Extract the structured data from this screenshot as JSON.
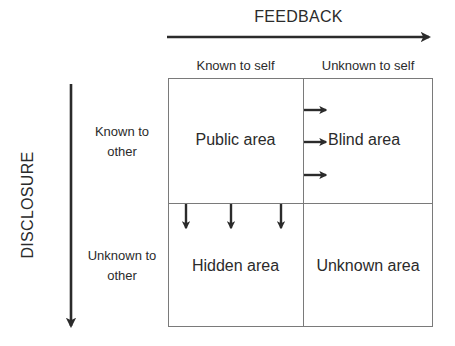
{
  "diagram": {
    "axes": {
      "horizontal": {
        "label": "FEEDBACK",
        "direction": "right"
      },
      "vertical": {
        "label": "DISCLOSURE",
        "direction": "down"
      }
    },
    "columns": [
      {
        "label": "Known to self"
      },
      {
        "label": "Unknown to self"
      }
    ],
    "rows": [
      {
        "label_line1": "Known to",
        "label_line2": "other"
      },
      {
        "label_line1": "Unknown to",
        "label_line2": "other"
      }
    ],
    "cells": {
      "public": "Public area",
      "blind": "Blind area",
      "hidden": "Hidden area",
      "unknown": "Unknown area"
    },
    "arrows": {
      "into_blind_count": 3,
      "into_hidden_count": 3
    },
    "colors": {
      "text": "#2b2b2b",
      "arrow": "#2b2b2b",
      "grid_line": "#7a7a7a",
      "background": "#ffffff"
    }
  }
}
